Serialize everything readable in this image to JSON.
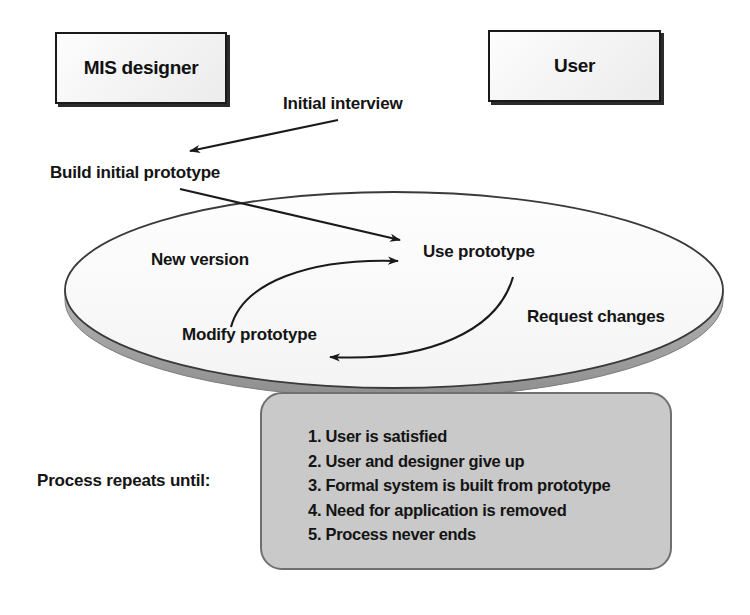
{
  "diagram": {
    "actors": [
      {
        "id": "mis-designer",
        "label": "MIS designer"
      },
      {
        "id": "user",
        "label": "User"
      }
    ],
    "flow_labels": {
      "initial_interview": "Initial interview",
      "build_initial_prototype": "Build initial prototype",
      "new_version": "New version",
      "use_prototype": "Use prototype",
      "modify_prototype": "Modify prototype",
      "request_changes": "Request changes",
      "process_repeats_until": "Process repeats until:"
    },
    "termination_conditions": [
      "1. User is satisfied",
      "2. User and designer give up",
      "3. Formal system is built from prototype",
      "4. Need for application is removed",
      "5. Process never ends"
    ],
    "colors": {
      "ink": "#141414",
      "actor_box_fill": "#f3f3f3",
      "actor_box_border": "#1a1a1a",
      "ellipse_fill": "#fbfbfb",
      "ellipse_border": "#3a3a3a",
      "ellipse_shadow": "#9a9a9a",
      "note_fill": "#c9c9c9",
      "note_border": "#6f6f6f",
      "page_background": "#ffffff"
    }
  }
}
